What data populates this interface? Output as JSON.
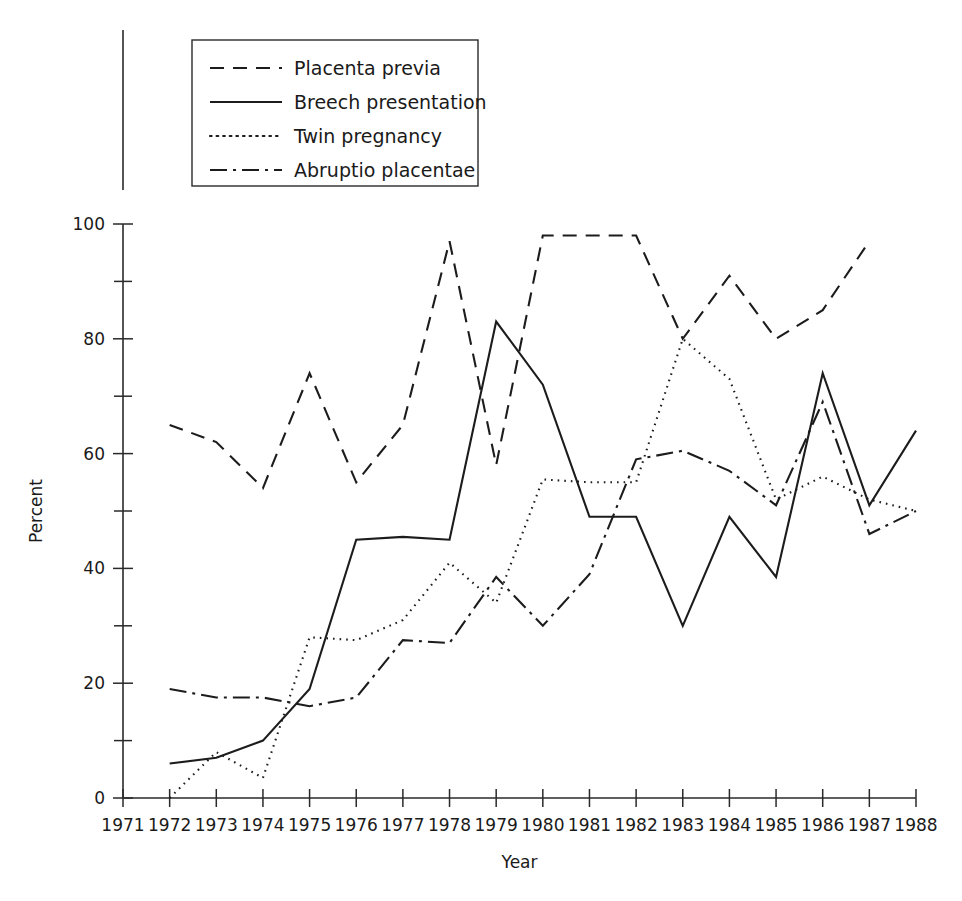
{
  "chart_data": {
    "type": "line",
    "title": "",
    "subtitle": "",
    "xlabel": "Year",
    "ylabel": "Percent",
    "xlim": [
      1971,
      1988
    ],
    "ylim": [
      0,
      100
    ],
    "grid": false,
    "legend_position": "top-left",
    "x_ticks": [
      1971,
      1972,
      1973,
      1974,
      1975,
      1976,
      1977,
      1978,
      1979,
      1980,
      1981,
      1982,
      1983,
      1984,
      1985,
      1986,
      1987,
      1988
    ],
    "x_tick_labels": [
      "1971",
      "1972",
      "1973",
      "1974",
      "1975",
      "1976",
      "1977",
      "1978",
      "1979",
      "1980",
      "1981",
      "1982",
      "1983",
      "1984",
      "1985",
      "1986",
      "1987",
      "1988"
    ],
    "y_ticks": [
      0,
      20,
      40,
      60,
      80,
      100
    ],
    "y_tick_labels": [
      "0",
      "20",
      "40",
      "60",
      "80",
      "100"
    ],
    "y_minor_ticks": [
      10,
      30,
      50,
      70,
      90
    ],
    "series": [
      {
        "name": "Placenta previa",
        "style": "dashed",
        "dasharray": "14,9",
        "x": [
          1972,
          1973,
          1974,
          1975,
          1976,
          1977,
          1978,
          1979,
          1980,
          1981,
          1982,
          1983,
          1984,
          1985,
          1986,
          1987
        ],
        "values": [
          65,
          62,
          54,
          74,
          55,
          65,
          97,
          58,
          98,
          98,
          98,
          80,
          91,
          80,
          85,
          97
        ]
      },
      {
        "name": "Breech presentation",
        "style": "solid",
        "dasharray": "none",
        "x": [
          1972,
          1973,
          1974,
          1975,
          1976,
          1977,
          1978,
          1979,
          1980,
          1981,
          1982,
          1983,
          1984,
          1985,
          1986,
          1987,
          1988
        ],
        "values": [
          6,
          7,
          10,
          19,
          45,
          45.5,
          45,
          83,
          72,
          49,
          49,
          30,
          49,
          38.5,
          74,
          51,
          64
        ]
      },
      {
        "name": "Twin pregnancy",
        "style": "dotted",
        "dasharray": "1.6,5",
        "x": [
          1972,
          1973,
          1974,
          1975,
          1976,
          1977,
          1978,
          1979,
          1980,
          1981,
          1982,
          1983,
          1984,
          1985,
          1986,
          1987,
          1988
        ],
        "values": [
          0,
          8,
          3.5,
          28,
          27.5,
          31,
          41,
          34,
          55.5,
          55,
          55,
          80,
          73,
          52,
          56,
          52,
          50
        ]
      },
      {
        "name": "Abruptio placentae",
        "style": "dash-dot",
        "dasharray": "17,6,3,6",
        "x": [
          1972,
          1973,
          1974,
          1975,
          1976,
          1977,
          1978,
          1979,
          1980,
          1981,
          1982,
          1983,
          1984,
          1985,
          1986,
          1987,
          1988
        ],
        "values": [
          19,
          17.5,
          17.5,
          16,
          17.5,
          27.5,
          27,
          38.5,
          30,
          39,
          59,
          60.5,
          57,
          51,
          69,
          46,
          50
        ]
      }
    ]
  },
  "legend": {
    "items": [
      {
        "label": "Placenta previa",
        "style": "dashed"
      },
      {
        "label": "Breech presentation",
        "style": "solid"
      },
      {
        "label": "Twin pregnancy",
        "style": "dotted"
      },
      {
        "label": "Abruptio placentae",
        "style": "dash-dot"
      }
    ]
  },
  "axes": {
    "x_title": "Year",
    "y_title": "Percent"
  }
}
